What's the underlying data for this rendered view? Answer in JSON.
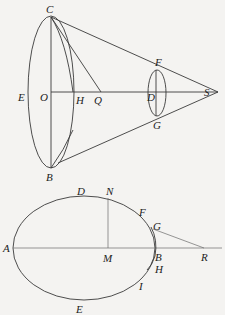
{
  "upper_figure": {
    "labels": {
      "C": "C",
      "E": "E",
      "O": "O",
      "H": "H",
      "Q": "Q",
      "B": "B",
      "F": "F",
      "D": "D",
      "G": "G",
      "S": "S"
    }
  },
  "lower_figure": {
    "labels": {
      "D": "D",
      "N": "N",
      "F": "F",
      "G": "G",
      "A": "A",
      "M": "M",
      "B": "B",
      "R": "R",
      "H": "H",
      "I": "I",
      "E": "E"
    }
  },
  "colors": {
    "background": "#f4f3f1",
    "line": "#3a3a3a",
    "text": "#222222"
  }
}
